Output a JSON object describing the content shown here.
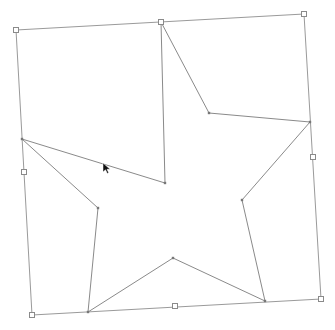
{
  "canvas": {
    "width": 335,
    "height": 330,
    "background": "#ffffff"
  },
  "colors": {
    "bbox_stroke": "#9a9a9a",
    "star_stroke": "#8a8a8a",
    "handle_stroke": "#8a8a8a",
    "node_fill": "#777777"
  },
  "bounding_box": {
    "corners": [
      [
        16,
        30
      ],
      [
        304,
        14
      ],
      [
        321,
        299
      ],
      [
        32,
        315
      ]
    ],
    "mid_handles": [
      [
        161,
        22
      ],
      [
        313,
        157
      ],
      [
        175,
        306
      ],
      [
        24,
        172
      ]
    ]
  },
  "star": {
    "points": [
      [
        161,
        22
      ],
      [
        209,
        113
      ],
      [
        310,
        122
      ],
      [
        242,
        200
      ],
      [
        265,
        301
      ],
      [
        173,
        258
      ],
      [
        88,
        312
      ],
      [
        98,
        208
      ],
      [
        22,
        139
      ],
      [
        165,
        183
      ]
    ]
  },
  "cursor": {
    "icon": "arrow-pointer-icon",
    "x": 103,
    "y": 163
  }
}
